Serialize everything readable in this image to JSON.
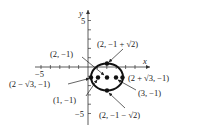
{
  "figure": {
    "axes": {
      "x_label": "x",
      "y_label": "y",
      "x_tick_label_neg": "−5",
      "y_tick_label_pos": "5",
      "y_tick_label_neg": "−5"
    },
    "ellipse": {
      "center": [
        2,
        -1
      ],
      "semi_axis_x": "√3",
      "semi_axis_y": "√2"
    },
    "points": [
      {
        "id": "center",
        "label": "(2, −1)"
      },
      {
        "id": "top-vertex",
        "label": "(2, −1 + √2)"
      },
      {
        "id": "bottom-vertex",
        "label": "(2, −1 − √2)"
      },
      {
        "id": "right-vertex",
        "label": "(2 + √3, −1)"
      },
      {
        "id": "left-vertex",
        "label": "(2 − √3, −1)"
      },
      {
        "id": "right-focus",
        "label": "(3, −1)"
      },
      {
        "id": "left-focus",
        "label": "(1, −1)"
      }
    ]
  }
}
